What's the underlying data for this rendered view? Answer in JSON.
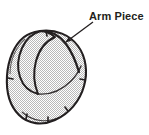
{
  "figure": {
    "type": "technical-line-drawing",
    "title_visible": false,
    "background_color": "#ffffff",
    "ink_color": "#231f20",
    "fill_texture": "stipple-dot-halftone",
    "fill_color": "#d9d9d9"
  },
  "annotations": [
    {
      "id": "arm-piece",
      "label": "Arm Piece",
      "label_x": 89,
      "label_y": 10,
      "leader": {
        "type": "arrow",
        "tail_x": 93,
        "tail_y": 22,
        "head_x": 64,
        "head_y": 44,
        "head_style": "solid-triangle"
      }
    }
  ],
  "shapes": {
    "body_outline": "large rounded kidney / oval panel, stippled fill, heavy black contour",
    "arm_piece_panel": "crescent panel overlapping the upper-left of the body outline",
    "seam_notches": 6,
    "notch_positions": [
      "left-edge-mid",
      "bottom-left",
      "bottom-center",
      "bottom-right",
      "right-edge-mid",
      "top-center"
    ]
  }
}
